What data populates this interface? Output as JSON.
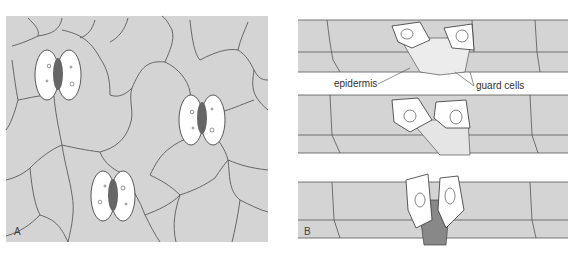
{
  "figure": {
    "panel_a": {
      "letter": "A",
      "description": "Surface view of leaf epidermis with three stomata"
    },
    "panel_b": {
      "letter": "B",
      "description": "Cross-sections of stoma showing guard cells in three states",
      "labels": {
        "epidermis": "epidermis",
        "guard_cells": "guard cells"
      }
    },
    "colors": {
      "cell_fill": "#d4d4d4",
      "cell_outline": "#555555",
      "guard_cell_fill": "#ffffff",
      "background": "#ffffff"
    }
  }
}
